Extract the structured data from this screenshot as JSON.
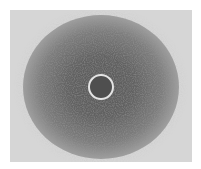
{
  "image": {
    "description": "grayscale photo of a dark noisy circular halo with a bright thin ring at its center",
    "colors": {
      "background": "#d6d6d6",
      "halo_core": "#5a5a5a",
      "ring": "#e4e4e4",
      "ring_center": "#4f4f4f"
    }
  }
}
